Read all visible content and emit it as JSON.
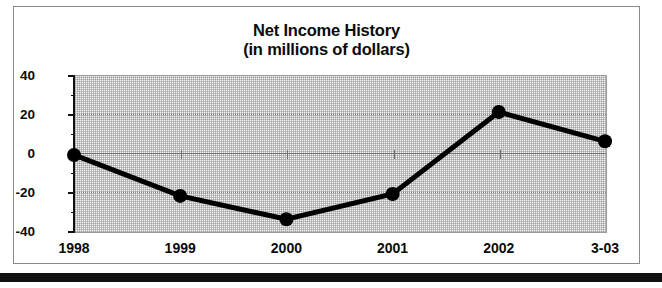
{
  "chart_data": {
    "type": "line",
    "title": "Net Income History",
    "subtitle": "(in millions of dollars)",
    "title_lines": [
      "Net Income History",
      "(in millions of dollars)"
    ],
    "xlabel": "",
    "ylabel": "",
    "categories": [
      "1998",
      "1999",
      "2000",
      "2001",
      "2002",
      "3-03"
    ],
    "values": [
      -1,
      -22,
      -34,
      -21,
      21,
      6
    ],
    "series": [
      {
        "name": "Net Income",
        "values": [
          -1,
          -22,
          -34,
          -21,
          21,
          6
        ]
      }
    ],
    "ylim": [
      -40,
      40
    ],
    "ytick_labels": [
      "40",
      "20",
      "0",
      "-20",
      "-40"
    ],
    "ytick_values": [
      40,
      20,
      0,
      -20,
      -40
    ],
    "yminor_step": 10,
    "grid": true,
    "legend": "none",
    "marker": "filled-circle",
    "line_color": "#000000",
    "marker_color": "#000000",
    "plot_background": "#f0f0f0",
    "gridline_color": "#8d8d8d",
    "zero_line_color": "#6f6f6f",
    "frame_border_color": "#8a8a8a"
  },
  "figure": {
    "border_label": "chart-frame"
  },
  "footer": {
    "bar_color": "#111111"
  }
}
